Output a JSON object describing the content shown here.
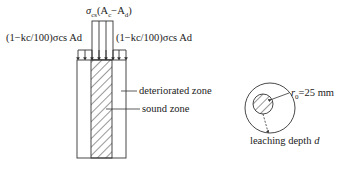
{
  "diagram": {
    "load_labels": {
      "center": "σcs(Ac−Ad)",
      "center_parts": {
        "sym": "σ",
        "sub": "cs",
        "paren": "(A",
        "sub2": "c",
        "minus": "−A",
        "sub3": "d",
        "close": ")"
      },
      "left": "(1−kc/100)σcs Ad",
      "right": "(1−kc/100)σcs Ad"
    },
    "zone_labels": {
      "deteriorated": "deteriorated zone",
      "sound": "sound zone"
    },
    "cross_section": {
      "radius_label": "r0=25 mm",
      "radius_value": "=25 mm",
      "depth_label": "leaching depth",
      "depth_symbol": "d"
    }
  }
}
